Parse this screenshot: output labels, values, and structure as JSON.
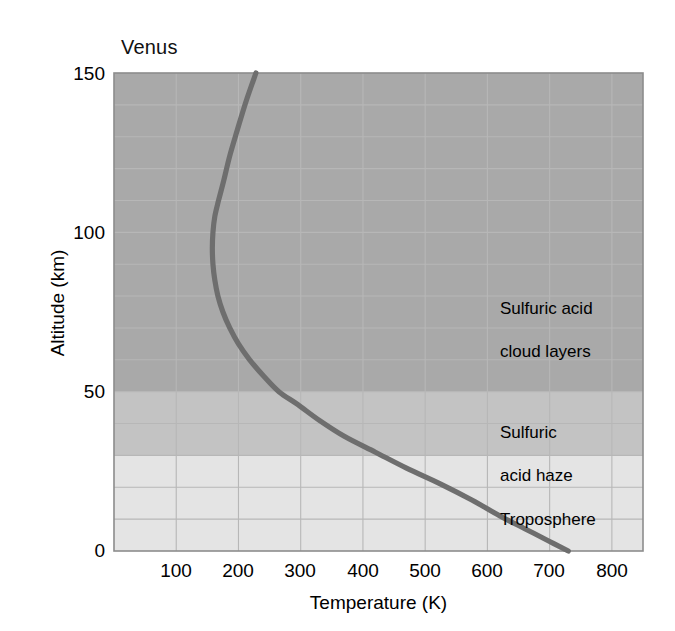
{
  "chart_data": {
    "type": "line",
    "title": "Venus",
    "xlabel": "Temperature (K)",
    "ylabel": "Altitude (km)",
    "xlim": [
      0,
      850
    ],
    "ylim": [
      0,
      150
    ],
    "xticks": [
      100,
      200,
      300,
      400,
      500,
      600,
      700,
      800
    ],
    "yticks": [
      0,
      50,
      100,
      150
    ],
    "grid": true,
    "legend": "none",
    "series": [
      {
        "name": "Venus temperature profile",
        "color": "#6e6e6e",
        "x": [
          730,
          700,
          660,
          620,
          575,
          525,
          470,
          420,
          370,
          330,
          295,
          265,
          240,
          218,
          200,
          186,
          175,
          167,
          162,
          159,
          158,
          159,
          162,
          168,
          176,
          186,
          198,
          212,
          228
        ],
        "y": [
          0,
          3,
          7,
          11,
          16,
          21,
          26,
          31,
          36,
          41,
          46,
          50,
          55,
          60,
          65,
          70,
          75,
          80,
          85,
          90,
          95,
          100,
          105,
          110,
          116,
          124,
          132,
          141,
          150
        ]
      }
    ],
    "bands": [
      {
        "name": "Sulfuric acid cloud layers",
        "ymin": 50,
        "ymax": 150,
        "color": "#a9a9a9",
        "label": "Sulfuric acid\ncloud layers",
        "label_x": 500,
        "label_y": 115
      },
      {
        "name": "Sulfuric acid haze",
        "ymin": 30,
        "ymax": 50,
        "color": "#c3c3c3",
        "label": "Sulfuric\nacid haze",
        "label_x": 500,
        "label_y": 42
      },
      {
        "name": "Troposphere",
        "ymin": 0,
        "ymax": 30,
        "color": "#e4e4e4",
        "label": "Troposphere",
        "label_x": 500,
        "label_y": 15
      }
    ],
    "annotations": [
      {
        "id": "cloud-layers",
        "line1": "Sulfuric acid",
        "line2": "cloud layers"
      },
      {
        "id": "acid-haze",
        "line1": "Sulfuric",
        "line2": "acid haze"
      },
      {
        "id": "troposphere",
        "line1": "Troposphere",
        "line2": ""
      }
    ]
  },
  "axes": {
    "xtick_labels": [
      "100",
      "200",
      "300",
      "400",
      "500",
      "600",
      "700",
      "800"
    ],
    "ytick_labels": [
      "0",
      "50",
      "100",
      "150"
    ]
  },
  "colors": {
    "curve": "#6e6e6e",
    "grid": "#b7b7b7",
    "frame": "#8c8c8c",
    "band_dark": "#a9a9a9",
    "band_mid": "#c3c3c3",
    "band_light": "#e4e4e4",
    "text": "#000000",
    "background": "#ffffff"
  }
}
